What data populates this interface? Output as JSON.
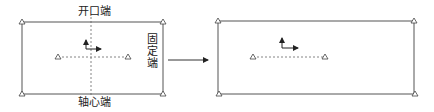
{
  "diagram": {
    "labels": {
      "top": "开口端",
      "bottom": "轴心端",
      "right": "固定端"
    },
    "left_panel": {
      "rect": {
        "x": 22,
        "y": 22,
        "w": 141,
        "h": 72
      },
      "corner_supports": "triangle",
      "support_triangle": "△",
      "dashed_cross": true,
      "inner_supports": [
        {
          "x": 58,
          "y": 57
        },
        {
          "x": 128,
          "y": 57
        }
      ]
    },
    "transition_arrow": {
      "x1": 168,
      "x2": 208,
      "y": 60
    },
    "right_panel": {
      "rect": {
        "x": 218,
        "y": 21,
        "w": 196,
        "h": 73
      },
      "corner_supports": "triangle",
      "dashed_line": true,
      "inner_supports": [
        {
          "x": 253,
          "y": 57
        },
        {
          "x": 325,
          "y": 57
        }
      ]
    },
    "colors": {
      "stroke": "#555555",
      "dashed": "#666666",
      "arrow": "#222222"
    }
  }
}
